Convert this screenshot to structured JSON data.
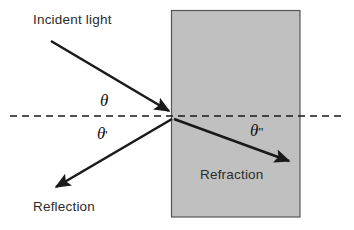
{
  "diagram": {
    "type": "optics-ray-diagram",
    "colors": {
      "background": "#ffffff",
      "medium_fill": "#c0c0c0",
      "medium_border": "#555555",
      "ray_stroke": "#1a1a1a",
      "interface_dash": "#1a1a1a",
      "text": "#2b2b2b"
    },
    "medium": {
      "name": "Refraction",
      "shape": "rectangle",
      "x": 171,
      "y": 10,
      "width": 129,
      "height": 207
    },
    "interface": {
      "name": "normal-dashed-line",
      "x1": 10,
      "y1": 116,
      "x2": 345,
      "y2": 116,
      "style": "dashed"
    },
    "incidence_point": {
      "x": 172,
      "y": 116
    },
    "labels": {
      "incident_light": "Incident light",
      "reflection": "Reflection",
      "refraction": "Refraction",
      "theta": "θ",
      "theta_prime_symbol": "θ",
      "theta_prime_mark": "'",
      "theta_double_prime_symbol": "θ",
      "theta_double_prime_mark": "\""
    },
    "rays": [
      {
        "name": "incident-ray",
        "label": "Incident light",
        "angle_label": "θ",
        "x1": 51,
        "y1": 41,
        "x2": 172,
        "y2": 113
      },
      {
        "name": "reflected-ray",
        "label": "Reflection",
        "angle_label": "θ'",
        "x1": 172,
        "y1": 119,
        "x2": 53,
        "y2": 189
      },
      {
        "name": "refracted-ray",
        "label": "Refraction",
        "angle_label": "θ\"",
        "x1": 174,
        "y1": 119,
        "x2": 292,
        "y2": 163
      }
    ]
  }
}
